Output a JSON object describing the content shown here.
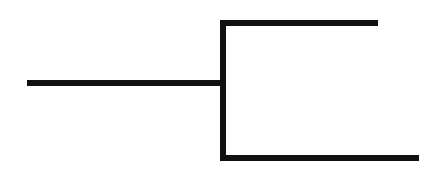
{
  "diagram": {
    "type": "tree-bracket",
    "line_color": "#111111",
    "background_color": "#ffffff",
    "stroke_width": 6,
    "segments": {
      "root_stem": {
        "x1": 27,
        "y": 83,
        "x2": 223
      },
      "vertical_connector": {
        "x": 223,
        "y1": 20,
        "y2": 161
      },
      "upper_branch": {
        "x1": 220,
        "y": 23,
        "x2": 378
      },
      "lower_branch": {
        "x1": 220,
        "y": 158,
        "x2": 419
      }
    },
    "nodes": [
      {
        "id": "root",
        "label": ""
      },
      {
        "id": "upper-leaf",
        "label": ""
      },
      {
        "id": "lower-leaf",
        "label": ""
      }
    ]
  }
}
